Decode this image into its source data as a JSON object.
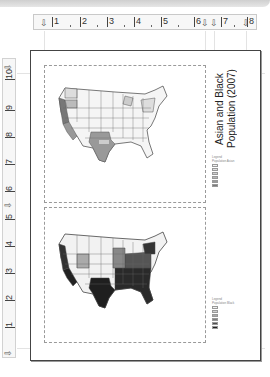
{
  "window": {
    "title_bar": ""
  },
  "horizontal_ruler": {
    "ticks": [
      "1",
      "2",
      "3",
      "4",
      "5",
      "6",
      "7",
      "8"
    ],
    "marker_icons": [
      "tab-marker",
      "indent-marker",
      "indent-marker",
      "tab-marker"
    ]
  },
  "vertical_ruler": {
    "ticks": [
      "1",
      "2",
      "3",
      "4",
      "5",
      "6",
      "7",
      "8",
      "9",
      "10"
    ]
  },
  "layout": {
    "title": "Asian and Black Population (2007)",
    "frames": [
      {
        "name": "map-frame-asian",
        "description": "US map choropleth - lighter palette"
      },
      {
        "name": "map-frame-black",
        "description": "US map choropleth - darker palette"
      }
    ],
    "legend_top": {
      "heading": "Legend",
      "sub_heading": "Population Asian",
      "classes": [
        "",
        "",
        "",
        "",
        "",
        ""
      ],
      "colors": [
        "#f2f2f2",
        "#e0e0e0",
        "#cfcfcf",
        "#b5b5b5",
        "#9a9a9a",
        "#7a7a7a"
      ]
    },
    "legend_bottom": {
      "heading": "Legend",
      "sub_heading": "Population Black",
      "classes": [
        "",
        "",
        "",
        "",
        "",
        ""
      ],
      "colors": [
        "#f0f0f0",
        "#d0d0d0",
        "#a9a9a9",
        "#7f7f7f",
        "#4f4f4f",
        "#222222"
      ]
    }
  },
  "colors": {
    "page_border": "#444444",
    "ruler_bg": "#f7f7f7",
    "frame_border": "#9a9a9a"
  }
}
